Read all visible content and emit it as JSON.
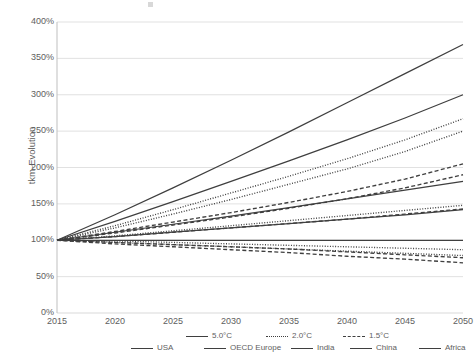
{
  "chart_data": {
    "type": "line",
    "title": "",
    "xlabel": "",
    "ylabel": "tkm-Evolution",
    "xlim": [
      2015,
      2050
    ],
    "ylim": [
      0,
      400
    ],
    "ytick_suffix": "%",
    "grid": true,
    "legend_position": "bottom",
    "x": [
      2015,
      2020,
      2025,
      2030,
      2035,
      2040,
      2045,
      2050
    ],
    "xticks": [
      "2015",
      "2020",
      "2025",
      "2030",
      "2035",
      "2040",
      "2045",
      "2050"
    ],
    "yticks": [
      "0%",
      "50%",
      "100%",
      "150%",
      "200%",
      "250%",
      "300%",
      "350%",
      "400%"
    ],
    "series": [
      {
        "name": "Africa 5.0°C",
        "region": "Africa",
        "scenario": "5.0°C",
        "style": "solid",
        "values": [
          100,
          135,
          172,
          210,
          249,
          289,
          329,
          369
        ]
      },
      {
        "name": "India 5.0°C",
        "region": "India",
        "scenario": "5.0°C",
        "style": "solid",
        "values": [
          100,
          126,
          153,
          181,
          209,
          238,
          268,
          300
        ]
      },
      {
        "name": "Africa 2.0°C",
        "region": "Africa",
        "scenario": "2.0°C",
        "style": "dotted",
        "values": [
          100,
          120,
          142,
          165,
          188,
          212,
          238,
          267
        ]
      },
      {
        "name": "India 2.0°C",
        "region": "India",
        "scenario": "2.0°C",
        "style": "dotted",
        "values": [
          100,
          117,
          136,
          156,
          177,
          198,
          222,
          250
        ]
      },
      {
        "name": "Africa 1.5°C",
        "region": "Africa",
        "scenario": "1.5°C",
        "style": "dashed",
        "values": [
          100,
          112,
          125,
          138,
          152,
          167,
          184,
          205
        ]
      },
      {
        "name": "India 1.5°C",
        "region": "India",
        "scenario": "1.5°C",
        "style": "dashed",
        "values": [
          100,
          110,
          121,
          132,
          144,
          157,
          172,
          190
        ]
      },
      {
        "name": "China 5.0°C",
        "region": "China",
        "scenario": "5.0°C",
        "style": "solid",
        "values": [
          100,
          111,
          122,
          133,
          145,
          157,
          169,
          181
        ]
      },
      {
        "name": "China 2.0°C",
        "region": "China",
        "scenario": "2.0°C",
        "style": "dotted",
        "values": [
          100,
          106,
          113,
          120,
          127,
          134,
          141,
          148
        ]
      },
      {
        "name": "China 1.5°C",
        "region": "China",
        "scenario": "1.5°C",
        "style": "dashed",
        "values": [
          100,
          105,
          111,
          117,
          123,
          129,
          136,
          143
        ]
      },
      {
        "name": "USA 5.0°C",
        "region": "USA",
        "scenario": "5.0°C",
        "style": "solid",
        "values": [
          100,
          105,
          111,
          117,
          123,
          129,
          135,
          142
        ]
      },
      {
        "name": "OECD Europe 5.0°C",
        "region": "OECD Europe",
        "scenario": "5.0°C",
        "style": "solid",
        "values": [
          100,
          100,
          100,
          100,
          100,
          100,
          100,
          100
        ]
      },
      {
        "name": "USA 2.0°C",
        "region": "USA",
        "scenario": "2.0°C",
        "style": "dotted",
        "values": [
          100,
          99,
          97,
          95,
          93,
          91,
          89,
          87
        ]
      },
      {
        "name": "OECD Europe 1.5°C",
        "region": "OECD Europe",
        "scenario": "1.5°C",
        "style": "dashed",
        "values": [
          100,
          97,
          94,
          91,
          88,
          84,
          80,
          76
        ]
      },
      {
        "name": "OECD Europe 2.0°C",
        "region": "OECD Europe",
        "scenario": "2.0°C",
        "style": "dotted",
        "values": [
          100,
          97,
          94,
          91,
          88,
          85,
          82,
          79
        ]
      },
      {
        "name": "USA 1.5°C",
        "region": "USA",
        "scenario": "1.5°C",
        "style": "dashed",
        "values": [
          100,
          95,
          91,
          87,
          83,
          78,
          74,
          69
        ]
      }
    ]
  },
  "axis": {
    "y_title": "tkm-Evolution",
    "yticks": [
      "400%",
      "350%",
      "300%",
      "250%",
      "200%",
      "150%",
      "100%",
      "50%",
      "0%"
    ],
    "xticks": [
      "2015",
      "2020",
      "2025",
      "2030",
      "2035",
      "2040",
      "2045",
      "2050"
    ]
  },
  "legend": {
    "scenarios": [
      {
        "label": "5.0°C",
        "style": "solid"
      },
      {
        "label": "2.0°C",
        "style": "dotted"
      },
      {
        "label": "1.5°C",
        "style": "dashed"
      }
    ],
    "regions": [
      {
        "label": "USA",
        "style": "solid"
      },
      {
        "label": "OECD Europe",
        "style": "solid"
      },
      {
        "label": "India",
        "style": "solid"
      },
      {
        "label": "China",
        "style": "solid"
      },
      {
        "label": "Africa",
        "style": "solid"
      }
    ]
  },
  "colors": {
    "line": "#3f3f3f",
    "grid": "#d9d9d9",
    "axis": "#bfbfbf",
    "text": "#5e5e5e",
    "background": "#ffffff"
  }
}
